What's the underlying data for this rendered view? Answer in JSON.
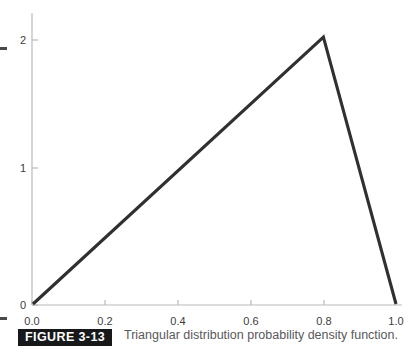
{
  "figure": {
    "label": "FIGURE 3-13",
    "caption": "Triangular distribution probability density function."
  },
  "colors": {
    "curve": "#303030",
    "axis": "#b9b9b9",
    "tick_text": "#3c3c3c",
    "label_box_bg": "#17181a",
    "label_box_text": "#ffffff",
    "caption_text": "#58595b",
    "background": "#ffffff"
  },
  "chart_data": {
    "type": "line",
    "title": "",
    "subtitle": "",
    "xlabel": "",
    "ylabel": "",
    "xlim": [
      0.0,
      1.0
    ],
    "ylim": [
      0.0,
      2.2
    ],
    "grid": false,
    "legend": null,
    "xticks": [
      0.0,
      0.2,
      0.4,
      0.6,
      0.8,
      1.0
    ],
    "xticklabels": [
      "0.0",
      "0.2",
      "0.4",
      "0.6",
      "0.8",
      "1.0"
    ],
    "yticks": [
      0,
      1,
      2
    ],
    "yticklabels": [
      "0",
      "1",
      "2"
    ],
    "series": [
      {
        "name": "Triangular pdf",
        "x": [
          0.0,
          0.8,
          1.0
        ],
        "y": [
          0.0,
          2.0,
          0.0
        ]
      }
    ],
    "annotations": []
  }
}
